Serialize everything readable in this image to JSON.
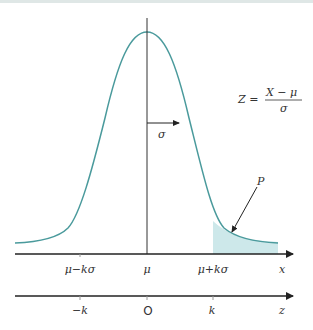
{
  "figure": {
    "colors": {
      "curve": "#4a9a9c",
      "shade": "#cde8ea",
      "axis": "#222222",
      "text": "#333333",
      "topbar": "#dfe7e6"
    },
    "formula": {
      "lhs": "Z =",
      "numerator": "X − μ",
      "denominator": "σ"
    },
    "sigma_label": "σ",
    "tail_label": "P",
    "x_axis": {
      "ticks": [
        "μ−kσ",
        "μ",
        "μ+kσ"
      ],
      "var": "x"
    },
    "z_axis": {
      "ticks": [
        "−k",
        "O",
        "k"
      ],
      "var": "z"
    }
  }
}
